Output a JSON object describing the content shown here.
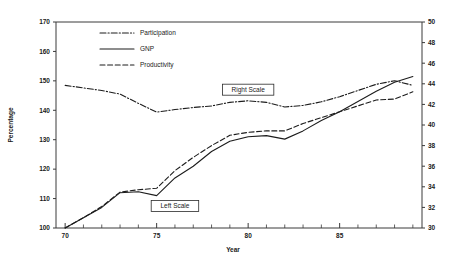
{
  "chart_data": {
    "type": "line",
    "title": "",
    "subtitle": "",
    "xlabel": "Year",
    "ylabel": "Percentage",
    "ylabel_right": "",
    "xlim": [
      69.5,
      89.5
    ],
    "ylim": [
      100,
      170
    ],
    "ylim_right": [
      30,
      50
    ],
    "grid": false,
    "legend_position": "top-center",
    "x_ticks_major": [
      "70",
      "75",
      "80",
      "85"
    ],
    "x_tick_values_major": [
      70,
      75,
      80,
      85
    ],
    "x_tick_values_minor": [
      71,
      72,
      73,
      74,
      76,
      77,
      78,
      79,
      81,
      82,
      83,
      84,
      86,
      87,
      88,
      89
    ],
    "y_ticks_left": [
      "100",
      "110",
      "120",
      "130",
      "140",
      "150",
      "160",
      "170"
    ],
    "y_tick_values_left": [
      100,
      110,
      120,
      130,
      140,
      150,
      160,
      170
    ],
    "y_ticks_right": [
      "30",
      "32",
      "34",
      "36",
      "38",
      "40",
      "42",
      "44",
      "46",
      "48",
      "50"
    ],
    "y_tick_values_right": [
      30,
      32,
      34,
      36,
      38,
      40,
      42,
      44,
      46,
      48,
      50
    ],
    "x": [
      1970,
      1971,
      1972,
      1973,
      1974,
      1975,
      1976,
      1977,
      1978,
      1979,
      1980,
      1981,
      1982,
      1983,
      1984,
      1985,
      1986,
      1987,
      1988,
      1989
    ],
    "series": [
      {
        "name": "Participation",
        "axis": "right",
        "dash": "dashdot",
        "values": [
          43.85,
          43.6,
          43.35,
          43.0,
          42.1,
          41.25,
          41.5,
          41.7,
          41.85,
          42.2,
          42.35,
          42.2,
          41.75,
          41.9,
          42.25,
          42.75,
          43.35,
          43.95,
          44.3,
          43.85
        ]
      },
      {
        "name": "GNP",
        "axis": "left",
        "dash": "solid",
        "values": [
          100.0,
          103.5,
          107.0,
          112.0,
          112.3,
          111.0,
          117.0,
          121.0,
          126.0,
          129.5,
          131.0,
          131.4,
          130.2,
          133.0,
          136.5,
          139.5,
          143.0,
          146.5,
          149.5,
          151.5
        ]
      },
      {
        "name": "Productivity",
        "axis": "left",
        "dash": "dashed",
        "values": [
          100.0,
          103.5,
          107.3,
          112.2,
          113.0,
          113.5,
          119.5,
          124.0,
          128.0,
          131.5,
          132.5,
          133.0,
          133.0,
          135.5,
          137.5,
          139.5,
          141.5,
          143.5,
          143.8,
          146.3
        ]
      }
    ],
    "annotations": [
      {
        "text": "Right Scale",
        "x_data": 80.0,
        "y_value_left": 147.0
      },
      {
        "text": "Left Scale",
        "x_data": 76.0,
        "y_value_left": 107.5
      }
    ]
  },
  "legend": {
    "items": [
      {
        "label": "Participation",
        "dash": "dashdot"
      },
      {
        "label": "GNP",
        "dash": "solid"
      },
      {
        "label": "Productivity",
        "dash": "dashed"
      }
    ]
  },
  "colors": {
    "background": "#ffffff",
    "ink": "#1c1c1c",
    "axis": "#3a3a3a"
  }
}
